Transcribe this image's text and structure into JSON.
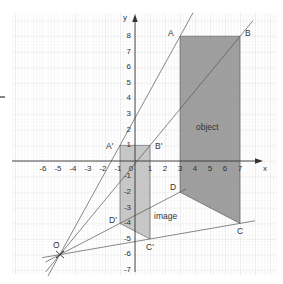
{
  "figure": {
    "axis_labels": {
      "x": "x",
      "y": "y"
    },
    "x_ticks": [
      "-6",
      "-5",
      "-4",
      "-3",
      "-2",
      "-1",
      "0",
      "1",
      "2",
      "3",
      "4",
      "5",
      "6",
      "7"
    ],
    "y_ticks": [
      "8",
      "7",
      "6",
      "5",
      "4",
      "3",
      "2",
      "1",
      "-1",
      "-2",
      "-3",
      "-4",
      "-5",
      "-6",
      "-7"
    ],
    "center": {
      "label": "O",
      "x": -5,
      "y": -6
    },
    "object": {
      "label": "object",
      "vertices": [
        {
          "label": "A",
          "x": 3,
          "y": 8
        },
        {
          "label": "B",
          "x": 7,
          "y": 8
        },
        {
          "label": "C",
          "x": 7,
          "y": -4
        },
        {
          "label": "D",
          "x": 3,
          "y": -2
        }
      ]
    },
    "image": {
      "label": "image",
      "vertices": [
        {
          "label": "A'",
          "x": -1,
          "y": 1
        },
        {
          "label": "B'",
          "x": 1,
          "y": 1
        },
        {
          "label": "C'",
          "x": 1,
          "y": -5
        },
        {
          "label": "D'",
          "x": -1,
          "y": -4
        }
      ]
    },
    "colors": {
      "grid_minor": "#e4e4e4",
      "grid_major": "#cfcfcf",
      "object_fill": "#8e8e8e",
      "image_fill": "#b9b9b9",
      "lines": "#555555",
      "axis": "#333333"
    }
  }
}
